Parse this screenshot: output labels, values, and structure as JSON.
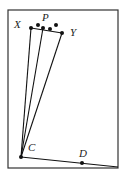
{
  "figure": {
    "frame": {
      "x": 8,
      "y": 10,
      "width": 110,
      "height": 158,
      "stroke": "#333333"
    },
    "points": [
      {
        "id": "X",
        "x": 31,
        "y": 28,
        "label": "X",
        "lx": 14,
        "ly": 28
      },
      {
        "id": "P1",
        "x": 38,
        "y": 25,
        "label": "",
        "lx": 0,
        "ly": 0
      },
      {
        "id": "P2",
        "x": 43,
        "y": 28,
        "label": "",
        "lx": 0,
        "ly": 0
      },
      {
        "id": "P3",
        "x": 50,
        "y": 29,
        "label": "",
        "lx": 0,
        "ly": 0
      },
      {
        "id": "P4",
        "x": 56,
        "y": 25,
        "label": "",
        "lx": 0,
        "ly": 0
      },
      {
        "id": "Y",
        "x": 62,
        "y": 33,
        "label": "Y",
        "lx": 70,
        "ly": 36
      },
      {
        "id": "C",
        "x": 21,
        "y": 157,
        "label": "C",
        "lx": 28,
        "ly": 151
      },
      {
        "id": "D",
        "x": 82,
        "y": 163,
        "label": "D",
        "lx": 79,
        "ly": 157
      }
    ],
    "labels": {
      "X": "X",
      "P": "P",
      "Y": "Y",
      "C": "C",
      "D": "D"
    },
    "p_label_pos": {
      "x": 42,
      "y": 21
    },
    "segments": [
      {
        "from": "C",
        "to": "X"
      },
      {
        "from": "C",
        "to": "P2"
      },
      {
        "from": "C",
        "to": "Y"
      },
      {
        "from": "X",
        "to": "Y"
      },
      {
        "from": "C",
        "to": "corner"
      }
    ],
    "corner": {
      "x": 118,
      "y": 167
    }
  }
}
